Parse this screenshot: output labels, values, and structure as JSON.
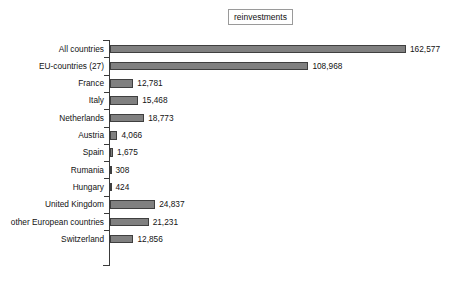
{
  "title": "reinvestments",
  "chart_data": {
    "type": "bar",
    "orientation": "horizontal",
    "title": "reinvestments",
    "xlabel": "",
    "ylabel": "",
    "grid": false,
    "legend": "none",
    "axis_visible": {
      "category_axis": true,
      "value_axis": false
    },
    "xlim": [
      0,
      162577
    ],
    "categories": [
      "All countries",
      "EU-countries (27)",
      "France",
      "Italy",
      "Netherlands",
      "Austria",
      "Spain",
      "Rumania",
      "Hungary",
      "United Kingdom",
      "other European countries",
      "Switzerland"
    ],
    "values": [
      162577,
      108968,
      12781,
      15468,
      18773,
      4066,
      1675,
      308,
      424,
      24837,
      21231,
      12856
    ],
    "value_labels": [
      "162,577",
      "108,968",
      "12,781",
      "15,468",
      "18,773",
      "4,066",
      "1,675",
      "308",
      "424",
      "24,837",
      "21,231",
      "12,856"
    ],
    "bar_color": "#808080",
    "bar_border_color": "#3f3f3f",
    "axis_color": "#3a3a3a",
    "text_color": "#121212",
    "background": "#ffffff"
  }
}
